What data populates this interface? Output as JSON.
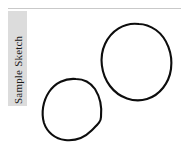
{
  "page": {
    "width": 181,
    "height": 152,
    "background_color": "#ffffff"
  },
  "rule": {
    "name": "top-divider",
    "color": "#c9c9c9"
  },
  "label": {
    "text": "Sample Sketch",
    "orientation": "vertical-rotated-90-ccw",
    "band_color": "#dcdcdc",
    "text_color": "#1a1a1a"
  },
  "sketch": {
    "stroke_color": "#0d0d0d",
    "stroke_width": 2.1,
    "fill": "none",
    "shapes": [
      {
        "name": "upper-right-loop",
        "description": "hand-drawn closed ovoid loop",
        "path": "M 139 24 C 124 22 111 31 105 44 C 99 57 101 74 110 86 C 119 98 134 103 147 99 C 160 95 169 83 171 69 C 173 54 167 38 156 30 C 150 26 145 24 139 24 Z"
      },
      {
        "name": "lower-left-loop",
        "description": "hand-drawn closed angular loop",
        "path": "M 76 79 C 65 78 55 83 49 92 C 43 101 41 113 44 123 C 47 132 55 139 65 140 C 74 141 84 138 91 131 C 97 125 101 122 101 117 C 102 108 100 97 95 89 C 90 82 84 79 76 79 Z"
      }
    ]
  }
}
